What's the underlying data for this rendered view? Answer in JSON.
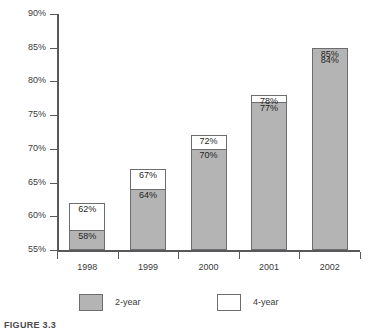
{
  "figure": {
    "caption": "FIGURE 3.3"
  },
  "chart_data": {
    "type": "bar",
    "title": "",
    "subtitle": "",
    "xlabel": "",
    "ylabel": "",
    "categories": [
      "1998",
      "1999",
      "2000",
      "2001",
      "2002"
    ],
    "series": [
      {
        "name": "2-year",
        "color": "#b4b4b4",
        "values": [
          58,
          64,
          70,
          77,
          85
        ],
        "labels": [
          "58%",
          "64%",
          "70%",
          "77%",
          "85%"
        ]
      },
      {
        "name": "4-year",
        "color": "#ffffff",
        "values": [
          62,
          67,
          72,
          78,
          84
        ],
        "labels": [
          "62%",
          "67%",
          "72%",
          "78%",
          "84%"
        ]
      }
    ],
    "ylim": [
      55,
      90
    ],
    "ytick_values": [
      55,
      60,
      65,
      70,
      75,
      80,
      85,
      90
    ],
    "ytick_labels": [
      "55%",
      "60%",
      "65%",
      "70%",
      "75%",
      "80%",
      "85%",
      "90%"
    ],
    "grid": false,
    "legend_position": "bottom",
    "legend": [
      {
        "label": "2-year",
        "swatch": "gray"
      },
      {
        "label": "4-year",
        "swatch": "white"
      }
    ]
  }
}
